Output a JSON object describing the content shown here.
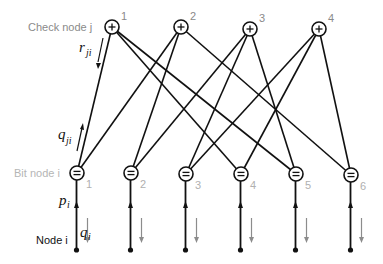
{
  "diagram": {
    "type": "tanner-graph",
    "labels": {
      "check_node": "Check node j",
      "bit_node": "Bit node i",
      "node": "Node i"
    },
    "math_labels": {
      "r": {
        "base": "r",
        "sub": "ji"
      },
      "q_ji": {
        "base": "q",
        "sub": "ji"
      },
      "p": {
        "base": "p",
        "sub": "i"
      },
      "q_i": {
        "base": "q",
        "sub": "i"
      }
    },
    "check_nodes": [
      {
        "index": "1",
        "symbol": "+",
        "x": 112,
        "y": 27
      },
      {
        "index": "2",
        "symbol": "+",
        "x": 181,
        "y": 27
      },
      {
        "index": "3",
        "symbol": "+",
        "x": 250,
        "y": 29
      },
      {
        "index": "4",
        "symbol": "+",
        "x": 319,
        "y": 29
      }
    ],
    "bit_nodes": [
      {
        "index": "1",
        "symbol": "=",
        "x": 77,
        "y": 173
      },
      {
        "index": "2",
        "symbol": "=",
        "x": 131,
        "y": 173
      },
      {
        "index": "3",
        "symbol": "=",
        "x": 186,
        "y": 174
      },
      {
        "index": "4",
        "symbol": "=",
        "x": 241,
        "y": 174
      },
      {
        "index": "5",
        "symbol": "=",
        "x": 296,
        "y": 174
      },
      {
        "index": "6",
        "symbol": "=",
        "x": 351,
        "y": 175
      }
    ],
    "edges": [
      {
        "check": 1,
        "bit": 1
      },
      {
        "check": 1,
        "bit": 4
      },
      {
        "check": 1,
        "bit": 5
      },
      {
        "check": 2,
        "bit": 1
      },
      {
        "check": 2,
        "bit": 2
      },
      {
        "check": 2,
        "bit": 6
      },
      {
        "check": 3,
        "bit": 2
      },
      {
        "check": 3,
        "bit": 3
      },
      {
        "check": 3,
        "bit": 5
      },
      {
        "check": 4,
        "bit": 3
      },
      {
        "check": 4,
        "bit": 4
      },
      {
        "check": 4,
        "bit": 6
      }
    ],
    "colors": {
      "edge": "#111111",
      "check_label": "#8a8a8a",
      "bit_label": "#b5b5b5",
      "flow_arrow": "#8c8c8c"
    }
  }
}
